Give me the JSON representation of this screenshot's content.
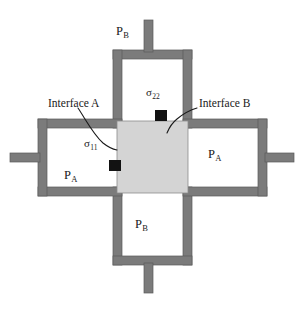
{
  "diagram": {
    "colors": {
      "bar_fill": "#7b7b7b",
      "bar_stroke": "#5a5a5a",
      "block_fill": "#d4d4d4",
      "block_stroke": "#8c8c8c",
      "marker_fill": "#121212",
      "leader_stroke": "#1a1a1a",
      "background": "#ffffff",
      "text": "#1a1a1a"
    },
    "labels": {
      "top_chamber": {
        "symbol": "P",
        "subscript": "B"
      },
      "bottom_chamber": {
        "symbol": "P",
        "subscript": "B"
      },
      "left_chamber": {
        "symbol": "P",
        "subscript": "A"
      },
      "right_chamber": {
        "symbol": "P",
        "subscript": "A"
      },
      "stress_horizontal": {
        "symbol": "σ",
        "subscript": "11"
      },
      "stress_vertical": {
        "symbol": "σ",
        "subscript": "22"
      },
      "interface_a": "Interface A",
      "interface_b": "Interface B"
    },
    "markers": [
      {
        "name": "sigma-11-marker",
        "x": 109,
        "y": 160,
        "w": 12,
        "h": 11
      },
      {
        "name": "sigma-22-marker",
        "x": 155,
        "y": 110,
        "w": 12,
        "h": 11
      }
    ],
    "center_block": {
      "x": 117,
      "y": 121,
      "w": 71,
      "h": 72
    }
  }
}
